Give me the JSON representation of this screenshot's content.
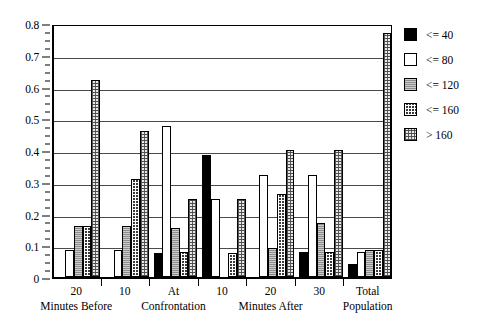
{
  "chart_data": {
    "type": "bar",
    "title": "",
    "subtitle": "",
    "xlabel": "",
    "ylabel": "",
    "ylim": [
      0,
      0.8
    ],
    "y_major_step": 0.1,
    "y_minor_step": 0.025,
    "grid": true,
    "legend_position": "right",
    "y_tick_labels": [
      "0.8",
      "0.7",
      "0.6",
      "0.5",
      "0.4",
      "0.3",
      "0.2",
      "0.1",
      "0"
    ],
    "y_tick_values": [
      0.8,
      0.7,
      0.6,
      0.5,
      0.4,
      0.3,
      0.2,
      0.1,
      0
    ],
    "categories": [
      {
        "line1": "20",
        "line2": "Minutes Before"
      },
      {
        "line1": "10",
        "line2": ""
      },
      {
        "line1": "At",
        "line2": "Confrontation"
      },
      {
        "line1": "10",
        "line2": ""
      },
      {
        "line1": "20",
        "line2": "Minutes After"
      },
      {
        "line1": "30",
        "line2": ""
      },
      {
        "line1": "Total",
        "line2": "Population"
      }
    ],
    "series": [
      {
        "name": "<= 40",
        "fill": "black",
        "values": [
          0.0,
          0.0,
          0.075,
          0.385,
          0.0,
          0.08,
          0.04
        ]
      },
      {
        "name": "<= 80",
        "fill": "white",
        "values": [
          0.085,
          0.085,
          0.475,
          0.245,
          0.32,
          0.32,
          0.08
        ]
      },
      {
        "name": "<= 120",
        "fill": "gray",
        "values": [
          0.16,
          0.16,
          0.155,
          0.0,
          0.09,
          0.17,
          0.085
        ]
      },
      {
        "name": "<= 160",
        "fill": "dark",
        "values": [
          0.16,
          0.31,
          0.08,
          0.075,
          0.26,
          0.08,
          0.085
        ]
      },
      {
        "name": "> 160",
        "fill": "light",
        "values": [
          0.62,
          0.46,
          0.245,
          0.245,
          0.4,
          0.4,
          0.77
        ]
      }
    ]
  },
  "legend": {
    "items": [
      {
        "label": "<= 40",
        "fill": "black"
      },
      {
        "label": "<= 80",
        "fill": "white"
      },
      {
        "label": "<= 120",
        "fill": "gray"
      },
      {
        "label": "<= 160",
        "fill": "dark"
      },
      {
        "label": "> 160",
        "fill": "light"
      }
    ]
  },
  "colors": {
    "axis": "#000000",
    "gridline": "#4a4a4a",
    "black": "#000000",
    "white": "#ffffff",
    "gray": "#8d8d8d",
    "dark": "#3a3a3a",
    "light": "#e9e9e9",
    "background": "#ffffff"
  }
}
